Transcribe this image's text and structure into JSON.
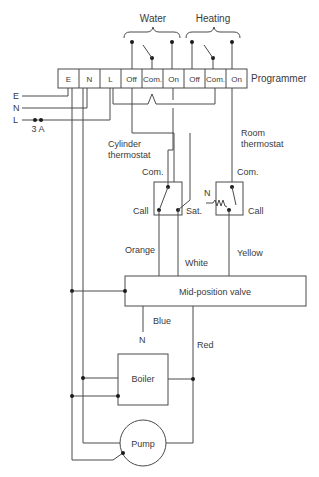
{
  "groups": {
    "water": "Water",
    "heating": "Heating"
  },
  "programmer": {
    "label": "Programmer",
    "terminals": [
      "E",
      "N",
      "L",
      "Off",
      "Com.",
      "On",
      "Off",
      "Com.",
      "On"
    ]
  },
  "supply": {
    "earth": "E",
    "neutral": "N",
    "live": "L",
    "fuse": "3 A"
  },
  "cylinder_thermostat": {
    "label_line1": "Cylinder",
    "label_line2": "thermostat",
    "com": "Com.",
    "call": "Call",
    "sat": "Sat."
  },
  "room_thermostat": {
    "label_line1": "Room",
    "label_line2": "thermostat",
    "com": "Com.",
    "call": "Call",
    "neutral": "N"
  },
  "wires": {
    "orange": "Orange",
    "white": "White",
    "yellow": "Yellow",
    "blue": "Blue",
    "blue_to": "N",
    "red": "Red"
  },
  "valve": {
    "label": "Mid-position valve"
  },
  "boiler": {
    "label": "Boiler"
  },
  "pump": {
    "label": "Pump"
  },
  "colors": {
    "line": "#4a4a4a",
    "text": "#3a3a3a",
    "dot": "#1a1a1a"
  }
}
